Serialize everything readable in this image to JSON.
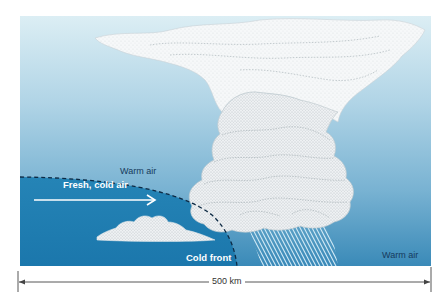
{
  "diagram": {
    "labels": {
      "warm_air_upper": "Warm air",
      "fresh_cold_air": "Fresh, cold air",
      "cold_front": "Cold front",
      "warm_air_right": "Warm air",
      "scale": "500 km"
    },
    "elements": {
      "cumulonimbus_cloud": "anvil-shaped thunderstorm cloud",
      "small_cloud": "low cumulus cloud in cold air mass",
      "rain": "precipitation streaks below storm",
      "front_boundary": "dashed cold front boundary",
      "cold_air_arrow": "arrow pointing right"
    },
    "colors": {
      "sky_top": "#d8ebf2",
      "sky_mid": "#8ebfd8",
      "sky_bottom": "#3d8cb8",
      "cold_air": "#1f7db2",
      "cloud": "#f7f9fa",
      "text_dark": "#163a5c",
      "text_light": "#ffffff"
    }
  }
}
